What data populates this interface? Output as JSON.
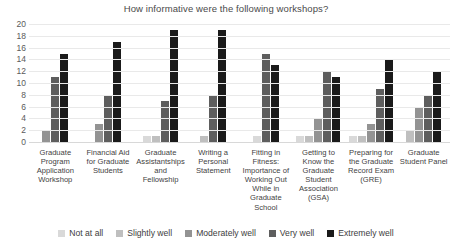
{
  "chart_data": {
    "type": "bar",
    "title": "How informative were the following workshops?",
    "xlabel": "",
    "ylabel": "",
    "ylim": [
      0,
      20
    ],
    "ytick_step": 2,
    "yticks": [
      20,
      18,
      16,
      14,
      12,
      10,
      8,
      6,
      4,
      2,
      0
    ],
    "grid": true,
    "legend_position": "bottom",
    "orientation": "vertical",
    "grouping": "clustered",
    "categories": [
      "Graduate Program Application Workshop",
      "Financial Aid for Graduate Students",
      "Graduate Assistantships and Fellowship",
      "Writing a Personal Statement",
      "Fitting in Fitness: Importance of Working Out While in Graduate School",
      "Getting to Know the Graduate Student Association (GSA)",
      "Preparing for the Graduate Record Exam (GRE)",
      "Graduate Student Panel"
    ],
    "series": [
      {
        "name": "Not at all",
        "color": "#d9d9d9",
        "values": [
          0,
          0,
          1,
          0,
          1,
          1,
          1,
          0
        ]
      },
      {
        "name": "Slightly well",
        "color": "#bfbfbf",
        "values": [
          0,
          0,
          1,
          1,
          0,
          1,
          1,
          2
        ]
      },
      {
        "name": "Moderately well",
        "color": "#939393",
        "values": [
          2,
          3,
          0,
          0,
          0,
          4,
          3,
          6
        ]
      },
      {
        "name": "Very well",
        "color": "#5e5e5e",
        "values": [
          11,
          8,
          7,
          8,
          15,
          12,
          9,
          8
        ]
      },
      {
        "name": "Extremely well",
        "color": "#1a1a1a",
        "values": [
          15,
          17,
          19,
          19,
          13,
          11,
          14,
          12
        ]
      }
    ]
  }
}
